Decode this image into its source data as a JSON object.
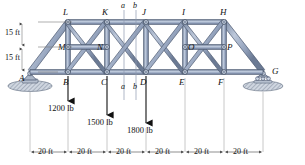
{
  "figure": {
    "colors": {
      "member_fill": "#9aa9c2",
      "member_light": "#b9c5d8",
      "member_dark": "#6d7c96",
      "outline": "#4e5a71",
      "joint_fill": "#c3cddd",
      "ground": "#9aa4b4",
      "dim_line": "#7a7a7a",
      "text": "#111111"
    }
  },
  "joints": {
    "bottom": [
      {
        "label": "A",
        "x": 30,
        "y": 72
      },
      {
        "label": "B",
        "x": 68,
        "y": 72
      },
      {
        "label": "C",
        "x": 107,
        "y": 72
      },
      {
        "label": "D",
        "x": 146,
        "y": 72
      },
      {
        "label": "E",
        "x": 185,
        "y": 72
      },
      {
        "label": "F",
        "x": 224,
        "y": 72
      },
      {
        "label": "G",
        "x": 263,
        "y": 72
      }
    ],
    "middle": [
      {
        "label": "M",
        "x": 68,
        "y": 47
      },
      {
        "label": "N",
        "x": 107,
        "y": 47
      },
      {
        "label": "O",
        "x": 185,
        "y": 47
      },
      {
        "label": "P",
        "x": 224,
        "y": 47
      }
    ],
    "top": [
      {
        "label": "L",
        "x": 68,
        "y": 22
      },
      {
        "label": "K",
        "x": 107,
        "y": 22
      },
      {
        "label": "J",
        "x": 146,
        "y": 22
      },
      {
        "label": "I",
        "x": 185,
        "y": 22
      },
      {
        "label": "H",
        "x": 224,
        "y": 22
      }
    ]
  },
  "loads": [
    {
      "label": "1200 lb",
      "joint": "B",
      "x": 68,
      "arrow_top": 76,
      "arrow_bottom": 104
    },
    {
      "label": "1500 lb",
      "joint": "C",
      "x": 107,
      "arrow_top": 76,
      "arrow_bottom": 118
    },
    {
      "label": "1800 lb",
      "joint": "D",
      "x": 146,
      "arrow_top": 76,
      "arrow_bottom": 126
    }
  ],
  "section_lines": {
    "top_labels": [
      {
        "label": "a",
        "x": 124
      },
      {
        "label": "b",
        "x": 136
      }
    ],
    "bottom_labels": [
      {
        "label": "a",
        "x": 124
      },
      {
        "label": "b",
        "x": 136
      }
    ]
  },
  "vertical_dimensions": [
    {
      "label": "15 ft",
      "from_y": 22,
      "to_y": 47
    },
    {
      "label": "15 ft",
      "from_y": 47,
      "to_y": 72
    }
  ],
  "horizontal_dimensions": [
    {
      "label": "20 ft",
      "from_x": 30,
      "to_x": 68
    },
    {
      "label": "20 ft",
      "from_x": 68,
      "to_x": 107
    },
    {
      "label": "20 ft",
      "from_x": 107,
      "to_x": 146
    },
    {
      "label": "20 ft",
      "from_x": 146,
      "to_x": 185
    },
    {
      "label": "20 ft",
      "from_x": 185,
      "to_x": 224
    },
    {
      "label": "20 ft",
      "from_x": 224,
      "to_x": 263
    }
  ],
  "supports": [
    {
      "type": "pin-support",
      "label": "A",
      "x": 30
    },
    {
      "type": "roller-support",
      "label": "G",
      "x": 263
    }
  ]
}
